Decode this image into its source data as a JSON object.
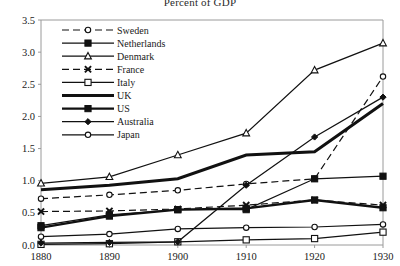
{
  "chart_data": {
    "type": "line",
    "title": "Percent of GDP",
    "xlabel": "",
    "ylabel": "",
    "x": [
      1880,
      1890,
      1900,
      1910,
      1920,
      1930
    ],
    "xtick_labels": [
      "1880",
      "1890",
      "1900",
      "1910",
      "1920",
      "1930"
    ],
    "ytick_labels": [
      "0.0",
      "0.5",
      "1.0",
      "1.5",
      "2.0",
      "2.5",
      "3.0",
      "3.5"
    ],
    "ylim": [
      0.0,
      3.5
    ],
    "xlim": [
      1880,
      1930
    ],
    "grid": false,
    "legend_position": "upper-left-inside",
    "series": [
      {
        "name": "Sweden",
        "marker": "open-circle",
        "dash": "dashed",
        "width": 1.2,
        "values": [
          0.72,
          0.78,
          0.85,
          0.95,
          1.03,
          2.62
        ]
      },
      {
        "name": "Netherlands",
        "marker": "filled-square",
        "dash": "solid",
        "width": 1.2,
        "values": [
          0.3,
          0.47,
          0.55,
          0.55,
          1.03,
          1.07
        ]
      },
      {
        "name": "Denmark",
        "marker": "open-triangle",
        "dash": "solid",
        "width": 1.2,
        "values": [
          0.96,
          1.06,
          1.4,
          1.74,
          2.72,
          3.14
        ]
      },
      {
        "name": "France",
        "marker": "x-cross",
        "dash": "dashed",
        "width": 1.2,
        "values": [
          0.52,
          0.53,
          0.56,
          0.62,
          0.7,
          0.62
        ]
      },
      {
        "name": "Italy",
        "marker": "open-square",
        "dash": "solid",
        "width": 1.2,
        "values": [
          0.01,
          0.02,
          0.05,
          0.08,
          0.1,
          0.2
        ]
      },
      {
        "name": "UK",
        "marker": "none",
        "dash": "solid",
        "width": 3.0,
        "values": [
          0.86,
          0.93,
          1.03,
          1.4,
          1.45,
          2.2
        ]
      },
      {
        "name": "US",
        "marker": "filled-square",
        "dash": "solid",
        "width": 2.4,
        "values": [
          0.27,
          0.45,
          0.55,
          0.57,
          0.7,
          0.58
        ]
      },
      {
        "name": "Australia",
        "marker": "filled-diamond",
        "dash": "solid",
        "width": 1.2,
        "values": [
          0.03,
          0.04,
          0.05,
          0.93,
          1.68,
          2.3
        ]
      },
      {
        "name": "Japan",
        "marker": "open-circle",
        "dash": "solid",
        "width": 1.2,
        "values": [
          0.13,
          0.17,
          0.25,
          0.27,
          0.28,
          0.32
        ]
      }
    ]
  }
}
